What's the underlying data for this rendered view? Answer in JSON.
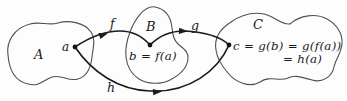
{
  "figure": {
    "type": "function-composition-diagram",
    "colors": {
      "background": "#fdfdfd",
      "blob_stroke": "#4f4f4f",
      "arrow_ink": "#1c1c1c",
      "text_ink": "#1a1a1a"
    },
    "sets": {
      "a_label": "A",
      "b_label": "B",
      "c_label": "C"
    },
    "functions": {
      "f_label": "f",
      "g_label": "g",
      "h_label": "h"
    },
    "elements": {
      "a_point_label": "a",
      "b_equation": "b = f(a)",
      "c_equation_line1": "c = g(b) = g(f(a))",
      "c_equation_line2": "= h(a)"
    }
  }
}
